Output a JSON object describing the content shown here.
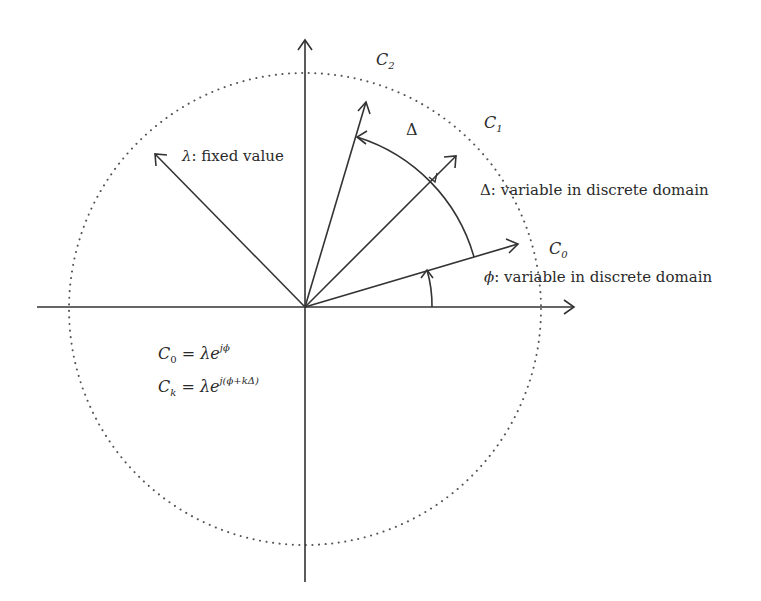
{
  "diagram": {
    "type": "phasor-constellation",
    "labels": {
      "c2": {
        "base": "C",
        "sub": "2"
      },
      "c1": {
        "base": "C",
        "sub": "1"
      },
      "c0": {
        "base": "C",
        "sub": "0"
      },
      "delta_arc": "Δ",
      "lambda_note": {
        "sym": "λ",
        "text": ": fixed value"
      },
      "delta_note": {
        "sym": "Δ",
        "text": ": variable in discrete domain"
      },
      "phi_note": {
        "sym": "ϕ",
        "text": ": variable in discrete domain"
      }
    },
    "equations": [
      {
        "lhs_base": "C",
        "lhs_sub": "0",
        "eq": " = ",
        "rhs_base": "λe",
        "rhs_sup": "jϕ"
      },
      {
        "lhs_base": "C",
        "lhs_sub": "k",
        "eq": " = ",
        "rhs_base": "λe",
        "rhs_sup": "j(ϕ+kΔ)"
      }
    ],
    "geometry": {
      "origin": [
        305,
        307
      ],
      "circle_radius": 236,
      "vector_angles_deg": {
        "c0": 17,
        "c1": 45,
        "c2": 74,
        "lambda": 135
      },
      "colors": {
        "stroke": "#333333",
        "dots": "#555555"
      }
    }
  }
}
